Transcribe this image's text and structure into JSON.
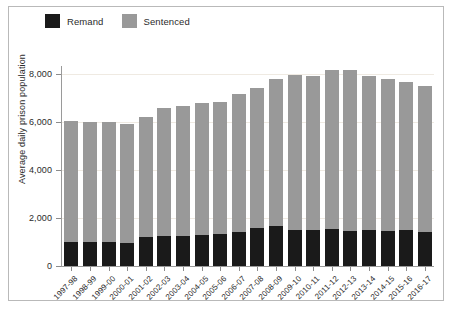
{
  "legend": {
    "position": "top-left",
    "items": [
      {
        "label": "Remand",
        "color": "#1a1a1a",
        "icon": "legend-swatch-remand"
      },
      {
        "label": "Sentenced",
        "color": "#999999",
        "icon": "legend-swatch-sentenced"
      }
    ]
  },
  "axes": {
    "ylabel": "Average daily prison population",
    "xlabel": "",
    "yticks": [
      "0",
      "2,000",
      "4,000",
      "6,000",
      "8,000"
    ]
  },
  "chart_data": {
    "type": "bar",
    "title": "",
    "subtitle": "",
    "xlabel": "",
    "ylabel": "Average daily prison population",
    "ylim": [
      0,
      8600
    ],
    "yticks": [
      0,
      2000,
      4000,
      6000,
      8000
    ],
    "ytick_labels": [
      "0",
      "2,000",
      "4,000",
      "6,000",
      "8,000"
    ],
    "grid": "horizontal-faint",
    "stacked": true,
    "legend_position": "top-left",
    "categories": [
      "1997-98",
      "1998-99",
      "1999-00",
      "2000-01",
      "2001-02",
      "2002-03",
      "2003-04",
      "2004-05",
      "2005-06",
      "2006-07",
      "2007-08",
      "2008-09",
      "2009-10",
      "2010-11",
      "2011-12",
      "2012-13",
      "2013-14",
      "2014-15",
      "2015-16",
      "2016-17"
    ],
    "series": [
      {
        "name": "Remand",
        "color": "#1a1a1a",
        "values": [
          1000,
          1000,
          1000,
          950,
          1200,
          1250,
          1250,
          1300,
          1350,
          1400,
          1600,
          1650,
          1500,
          1500,
          1550,
          1450,
          1500,
          1450,
          1500,
          1400
        ]
      },
      {
        "name": "Sentenced",
        "color": "#999999",
        "values": [
          5050,
          5000,
          5000,
          4950,
          5000,
          5350,
          5400,
          5500,
          5500,
          5750,
          5800,
          6150,
          6450,
          6400,
          6600,
          6700,
          6400,
          6350,
          6150,
          6100
        ]
      }
    ],
    "totals": [
      6050,
      6000,
      6000,
      5900,
      6200,
      6600,
      6650,
      6800,
      6850,
      7150,
      7400,
      7800,
      7950,
      7900,
      8150,
      8150,
      7900,
      7800,
      7650,
      7500
    ]
  }
}
